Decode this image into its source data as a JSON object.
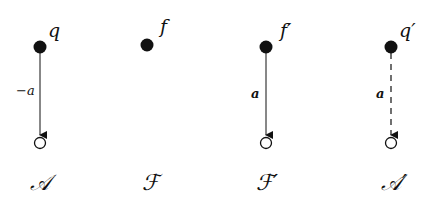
{
  "diagrams": [
    {
      "name": "A",
      "title": "𝒜",
      "node_label": "q",
      "edge_label": "−a",
      "edge_style": "solid",
      "has_edge": true
    },
    {
      "name": "F",
      "title": "ℱ",
      "node_label": "f",
      "edge_label": "",
      "edge_style": "none",
      "has_edge": false
    },
    {
      "name": "F-prime",
      "title": "ℱ′",
      "node_label": "f′",
      "edge_label": "a",
      "edge_style": "solid",
      "has_edge": true
    },
    {
      "name": "A-prime",
      "title": "𝒜′",
      "node_label": "q′",
      "edge_label": "a",
      "edge_style": "dashed",
      "has_edge": true
    }
  ]
}
